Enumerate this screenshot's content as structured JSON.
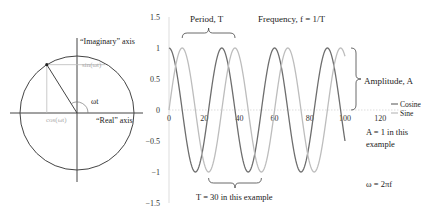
{
  "circle_diagram": {
    "imaginary_axis_label": "“Imaginary” axis",
    "real_axis_label": "“Real” axis",
    "angle_label": "ωt",
    "cos_label": "cos(ωt)",
    "sin_label": "sin(ωt)",
    "angle_degrees": 122
  },
  "annotations": {
    "period": "Period, T",
    "frequency": "Frequency, f = 1/T",
    "amplitude": "Amplitude, A",
    "period_example": "T = 30 in this example",
    "amplitude_example_line1": "A = 1 in this",
    "amplitude_example_line2": "example",
    "omega": "ω = 2πf"
  },
  "chart_data": {
    "type": "line",
    "title": "",
    "xlabel": "",
    "ylabel": "",
    "xlim": [
      0,
      120
    ],
    "ylim": [
      -1.5,
      1.5
    ],
    "x_ticks": [
      0,
      20,
      40,
      60,
      80,
      100,
      120
    ],
    "y_ticks": [
      1.5,
      1,
      0.5,
      0,
      -0.5,
      -1,
      -1.5
    ],
    "y_tick_labels": [
      "1.5",
      "1",
      "0.5",
      "0",
      "−0.5",
      "−1",
      "−1.5"
    ],
    "period": 30,
    "amplitude": 1,
    "x_range": [
      0,
      100
    ],
    "legend_position": "right",
    "series": [
      {
        "name": "Cosine",
        "function": "cos",
        "color": "#6e6e6e"
      },
      {
        "name": "Sine",
        "function": "sin",
        "color": "#bdbdbd"
      }
    ]
  }
}
